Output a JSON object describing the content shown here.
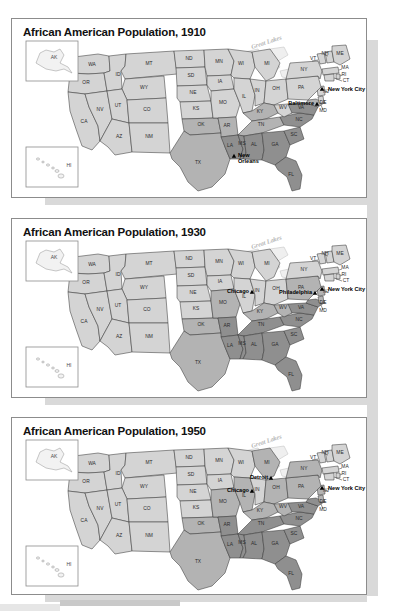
{
  "document": {
    "kind": "map-series",
    "series_title": "African American Population",
    "panel_count": 3
  },
  "panels": [
    {
      "title": "African American Population, 1910",
      "year": "1910",
      "lakes_label": "Great Lakes",
      "cities": [
        {
          "name": "New York City",
          "side": "right"
        },
        {
          "name": "Baltimore",
          "side": "left"
        },
        {
          "name": "New\nOrleans",
          "side": "right"
        }
      ],
      "city_names": [
        "New York City",
        "Baltimore",
        "New Orleans"
      ],
      "insets": [
        {
          "label": "AK"
        },
        {
          "label": "HI"
        }
      ],
      "shading": {
        "tier1_light": [
          "WA",
          "OR",
          "ID",
          "MT",
          "WY",
          "NV",
          "UT",
          "CO",
          "AZ",
          "NM",
          "ND",
          "SD",
          "NE",
          "KS",
          "MN",
          "IA",
          "WI",
          "MI",
          "IL",
          "IN",
          "OH",
          "PA",
          "NY",
          "ME",
          "NH",
          "VT",
          "MA",
          "RI",
          "CT",
          "NJ",
          "CA",
          "MO",
          "WV",
          "DE"
        ],
        "tier2_medium": [
          "TX",
          "OK",
          "AR",
          "KY",
          "TN",
          "MD"
        ],
        "tier3_dark": [
          "LA",
          "MS",
          "AL",
          "GA",
          "FL",
          "SC",
          "NC",
          "VA"
        ]
      }
    },
    {
      "title": "African American Population, 1930",
      "year": "1930",
      "lakes_label": "Great Lakes",
      "cities": [
        {
          "name": "New York City",
          "side": "right"
        },
        {
          "name": "Philadelphia",
          "side": "left"
        },
        {
          "name": "Chicago",
          "side": "left"
        }
      ],
      "city_names": [
        "New York City",
        "Philadelphia",
        "Chicago"
      ],
      "insets": [
        {
          "label": "AK"
        },
        {
          "label": "HI"
        }
      ],
      "shading": {
        "tier1_light": [
          "WA",
          "OR",
          "ID",
          "MT",
          "WY",
          "NV",
          "UT",
          "CO",
          "AZ",
          "NM",
          "ND",
          "SD",
          "NE",
          "KS",
          "MN",
          "IA",
          "WI",
          "MI",
          "IL",
          "IN",
          "OH",
          "NY",
          "ME",
          "NH",
          "VT",
          "MA",
          "RI",
          "CT",
          "CA"
        ],
        "tier2_medium": [
          "TX",
          "OK",
          "MO",
          "KY",
          "PA",
          "NJ",
          "WV",
          "DE"
        ],
        "tier3_dark": [
          "AR",
          "LA",
          "MS",
          "AL",
          "GA",
          "FL",
          "SC",
          "NC",
          "TN",
          "VA",
          "MD"
        ]
      }
    },
    {
      "title": "African American Population, 1950",
      "year": "1950",
      "lakes_label": "Great Lakes",
      "cities": [
        {
          "name": "New York City",
          "side": "right"
        },
        {
          "name": "Detroit",
          "side": "left"
        },
        {
          "name": "Chicago",
          "side": "left"
        }
      ],
      "city_names": [
        "New York City",
        "Detroit",
        "Chicago"
      ],
      "insets": [
        {
          "label": "AK"
        },
        {
          "label": "HI"
        }
      ],
      "shading": {
        "tier1_light": [
          "WA",
          "OR",
          "ID",
          "MT",
          "WY",
          "NV",
          "UT",
          "CO",
          "AZ",
          "NM",
          "ND",
          "SD",
          "NE",
          "KS",
          "MN",
          "IA",
          "WI",
          "CA",
          "IN",
          "ME",
          "NH",
          "VT",
          "MA",
          "RI",
          "CT"
        ],
        "tier2_medium": [
          "TX",
          "OK",
          "MO",
          "IL",
          "MI",
          "OH",
          "PA",
          "NY",
          "NJ",
          "DE",
          "WV",
          "KY"
        ],
        "tier3_dark": [
          "AR",
          "LA",
          "MS",
          "AL",
          "GA",
          "FL",
          "SC",
          "NC",
          "TN",
          "VA",
          "MD"
        ]
      }
    }
  ],
  "state_labels": [
    "AK",
    "WA",
    "OR",
    "ID",
    "MT",
    "WY",
    "ND",
    "SD",
    "NE",
    "MN",
    "IA",
    "WI",
    "MI",
    "NV",
    "UT",
    "CO",
    "AZ",
    "NM",
    "KS",
    "MO",
    "IL",
    "IN",
    "OH",
    "PA",
    "NY",
    "VT",
    "NH",
    "ME",
    "MA",
    "RI",
    "CT",
    "NJ",
    "DE",
    "MD",
    "WV",
    "VA",
    "KY",
    "TN",
    "NC",
    "SC",
    "GA",
    "AL",
    "MS",
    "AR",
    "LA",
    "OK",
    "TX",
    "FL",
    "CA",
    "HI"
  ],
  "colors": {
    "tier1_light": "#d4d4d4",
    "tier2_medium": "#b3b3b3",
    "tier3_dark": "#8f8f8f",
    "lake": "#efefef",
    "border": "#3a3a3a",
    "panel_border": "#8c8c8c",
    "page_band": "#d9d9d9",
    "text": "#111111"
  }
}
